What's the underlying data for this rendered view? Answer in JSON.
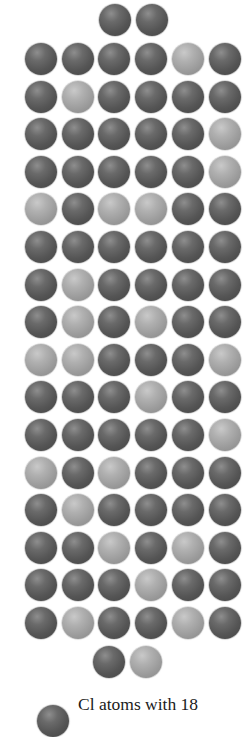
{
  "diagram": {
    "colors": {
      "dark_atom": "#555555",
      "light_atom": "#a0a0a0",
      "background": "#ffffff",
      "text": "#1a1a1a"
    },
    "layout": {
      "atom_diameter": 32,
      "column_x_centers": [
        41,
        78,
        114,
        151,
        188,
        225
      ],
      "row_y_start": 59,
      "row_spacing": 37.6
    },
    "top_pair": {
      "y_center": 20,
      "x_centers": [
        115,
        152
      ],
      "atoms": [
        "dark",
        "dark"
      ]
    },
    "rows": [
      [
        "dark",
        "dark",
        "dark",
        "dark",
        "light",
        "dark"
      ],
      [
        "dark",
        "light",
        "dark",
        "dark",
        "dark",
        "dark"
      ],
      [
        "dark",
        "dark",
        "dark",
        "dark",
        "dark",
        "light"
      ],
      [
        "dark",
        "dark",
        "dark",
        "dark",
        "dark",
        "light"
      ],
      [
        "light",
        "dark",
        "light",
        "light",
        "dark",
        "dark"
      ],
      [
        "dark",
        "dark",
        "dark",
        "dark",
        "dark",
        "dark"
      ],
      [
        "dark",
        "light",
        "dark",
        "dark",
        "dark",
        "dark"
      ],
      [
        "dark",
        "light",
        "dark",
        "light",
        "dark",
        "dark"
      ],
      [
        "light",
        "light",
        "dark",
        "dark",
        "dark",
        "light"
      ],
      [
        "dark",
        "dark",
        "dark",
        "light",
        "dark",
        "dark"
      ],
      [
        "dark",
        "dark",
        "dark",
        "dark",
        "dark",
        "light"
      ],
      [
        "light",
        "dark",
        "light",
        "dark",
        "dark",
        "dark"
      ],
      [
        "dark",
        "light",
        "dark",
        "dark",
        "dark",
        "dark"
      ],
      [
        "dark",
        "dark",
        "light",
        "dark",
        "light",
        "dark"
      ],
      [
        "dark",
        "dark",
        "dark",
        "light",
        "dark",
        "dark"
      ],
      [
        "dark",
        "light",
        "dark",
        "dark",
        "light",
        "dark"
      ]
    ],
    "bottom_pair": {
      "y_center": 662,
      "x_centers": [
        109,
        146
      ],
      "atoms": [
        "dark",
        "light"
      ]
    },
    "counts": {
      "total_atoms": 100,
      "light_atoms": 25,
      "dark_atoms": 75
    }
  },
  "legend": {
    "atom": "dark",
    "label": "Cl atoms with 18"
  }
}
